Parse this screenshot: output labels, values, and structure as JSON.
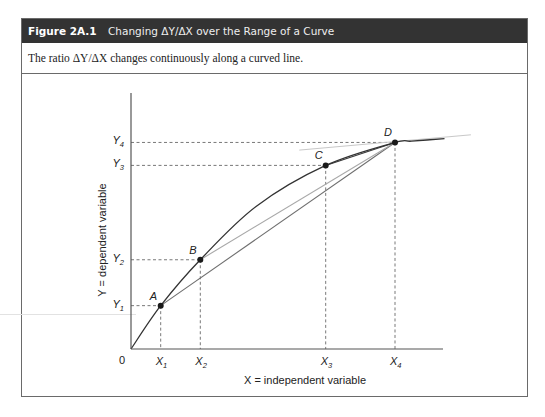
{
  "figure": {
    "number": "Figure 2A.1",
    "title": "Changing ΔY/ΔX over the Range of a Curve",
    "caption": "The ratio ΔY/ΔX changes continuously along a curved line."
  },
  "chart_data": {
    "type": "line",
    "title": "Changing ΔY/ΔX over the Range of a Curve",
    "xlabel": "X = independent variable",
    "ylabel": "Y = dependent variable",
    "origin_label": "0",
    "x_ticks": [
      {
        "label": "X",
        "sub": "1"
      },
      {
        "label": "X",
        "sub": "2"
      },
      {
        "label": "X",
        "sub": "3"
      },
      {
        "label": "X",
        "sub": "4"
      }
    ],
    "y_ticks": [
      {
        "label": "Y",
        "sub": "1"
      },
      {
        "label": "Y",
        "sub": "2"
      },
      {
        "label": "Y",
        "sub": "3"
      },
      {
        "label": "Y",
        "sub": "4"
      }
    ],
    "xlim": [
      0,
      100
    ],
    "ylim": [
      0,
      100
    ],
    "grid": false,
    "curve": {
      "name": "curve",
      "x": [
        0,
        9,
        21,
        38,
        59,
        80,
        85,
        95
      ],
      "y": [
        0,
        17,
        35,
        56,
        72,
        81,
        81.5,
        82.5
      ]
    },
    "points": [
      {
        "label": "A",
        "x": 9,
        "y": 17
      },
      {
        "label": "B",
        "x": 21,
        "y": 35
      },
      {
        "label": "C",
        "x": 59,
        "y": 72
      },
      {
        "label": "D",
        "x": 80,
        "y": 81
      }
    ],
    "chords": [
      {
        "from": "A",
        "to": "D",
        "color": "#6e6e6e"
      },
      {
        "from": "B",
        "to": "D",
        "color": "#a8a8a8"
      },
      {
        "from": "C",
        "to": "D",
        "color": "#3a3a3a"
      }
    ],
    "tangent_at_D": {
      "x": [
        51,
        103
      ],
      "y": [
        78,
        84
      ],
      "color": "#c8c8c8"
    },
    "colors": {
      "curve": "#333333",
      "axis": "#555555",
      "dash": "#555555",
      "point": "#1a1a1a",
      "header_bg": "#333333"
    }
  }
}
